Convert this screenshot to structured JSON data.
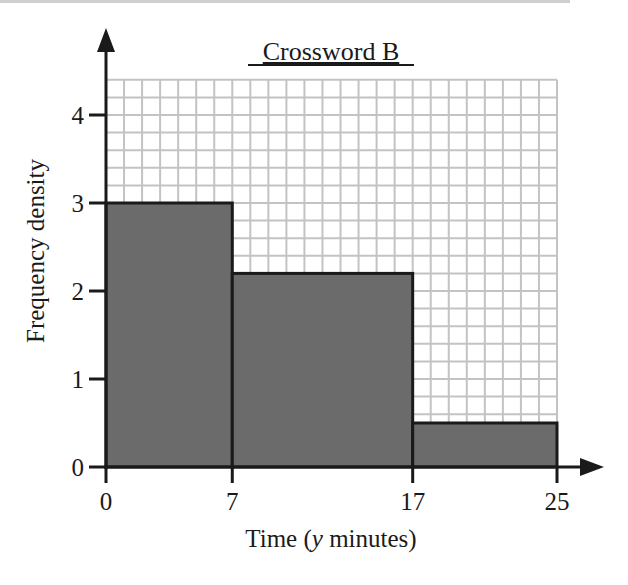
{
  "chart_data": {
    "type": "histogram",
    "title": "Crossword B",
    "xlabel": "Time (y minutes)",
    "xlabel_parts": {
      "prefix": "Time (",
      "var": "y",
      "suffix": " minutes)"
    },
    "ylabel": "Frequency density",
    "x_ticks": [
      0,
      7,
      17,
      25
    ],
    "y_ticks": [
      0,
      1,
      2,
      3,
      4
    ],
    "xlim": [
      0,
      25
    ],
    "ylim": [
      0,
      4.4
    ],
    "grid": true,
    "bins": [
      {
        "from": 0,
        "to": 7,
        "frequency_density": 3.0
      },
      {
        "from": 7,
        "to": 17,
        "frequency_density": 2.2
      },
      {
        "from": 17,
        "to": 25,
        "frequency_density": 0.5
      }
    ],
    "categories": [
      "0-7",
      "7-17",
      "17-25"
    ],
    "values": [
      3.0,
      2.2,
      0.5
    ],
    "colors": {
      "bar": "#6b6b6b",
      "grid": "#c3c3c3",
      "axis": "#1a1a1a"
    }
  }
}
